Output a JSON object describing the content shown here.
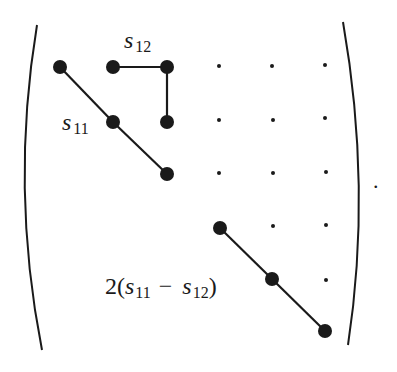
{
  "diagram": {
    "labels": {
      "s12": {
        "base": "s",
        "sub": "12"
      },
      "s11": {
        "base": "s",
        "sub": "11"
      },
      "shear": {
        "prefix": "2(",
        "a_base": "s",
        "a_sub": "11",
        "minus": "−",
        "b_base": "s",
        "b_sub": "12",
        "suffix": ")"
      },
      "period": "."
    },
    "colors": {
      "ink": "#1a1a1a",
      "background": "#ffffff"
    },
    "nodes": [
      {
        "id": "n11",
        "x": 60,
        "y": 67
      },
      {
        "id": "n12",
        "x": 113,
        "y": 67
      },
      {
        "id": "n13",
        "x": 167,
        "y": 67
      },
      {
        "id": "n22",
        "x": 113,
        "y": 122
      },
      {
        "id": "n23",
        "x": 167,
        "y": 122
      },
      {
        "id": "n33",
        "x": 167,
        "y": 174
      },
      {
        "id": "n44",
        "x": 220,
        "y": 228
      },
      {
        "id": "n55",
        "x": 272,
        "y": 279
      },
      {
        "id": "n66",
        "x": 325,
        "y": 331
      }
    ],
    "edges": [
      [
        "n11",
        "n22"
      ],
      [
        "n22",
        "n33"
      ],
      [
        "n12",
        "n13"
      ],
      [
        "n13",
        "n23"
      ],
      [
        "n44",
        "n55"
      ],
      [
        "n55",
        "n66"
      ]
    ],
    "zeros": [
      {
        "x": 219,
        "y": 66
      },
      {
        "x": 272,
        "y": 66
      },
      {
        "x": 325,
        "y": 65
      },
      {
        "x": 219,
        "y": 120
      },
      {
        "x": 273,
        "y": 120
      },
      {
        "x": 325,
        "y": 118
      },
      {
        "x": 219,
        "y": 173
      },
      {
        "x": 273,
        "y": 173
      },
      {
        "x": 326,
        "y": 172
      },
      {
        "x": 273,
        "y": 226
      },
      {
        "x": 326,
        "y": 225
      },
      {
        "x": 326,
        "y": 280
      }
    ]
  }
}
